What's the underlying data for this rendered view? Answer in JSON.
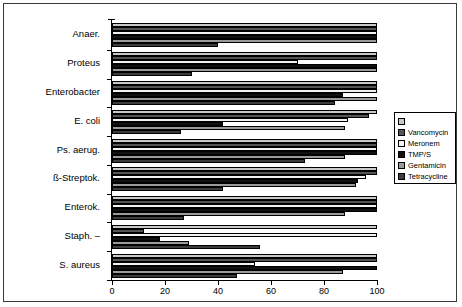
{
  "chart_data": {
    "type": "bar",
    "orientation": "horizontal",
    "title": "",
    "xlabel": "",
    "ylabel": "",
    "xlim": [
      0,
      100
    ],
    "xticks": [
      0,
      20,
      40,
      60,
      80,
      100
    ],
    "grid": false,
    "legend_position": "right",
    "categories": [
      "Anaer.",
      "Proteus",
      "Enterobacter",
      "E. coli",
      "Ps. aerug.",
      "ß-Streptok.",
      "Enterok.",
      "Staph. –",
      "S. aureus"
    ],
    "series": [
      {
        "name": "",
        "color": "#c8c8c8",
        "values": [
          100,
          100,
          100,
          100,
          100,
          100,
          100,
          100,
          100
        ]
      },
      {
        "name": "Vancomycin",
        "color": "#555555",
        "values": [
          100,
          100,
          100,
          97,
          100,
          100,
          100,
          12,
          100
        ]
      },
      {
        "name": "Meronem",
        "color": "#f2f2f2",
        "values": [
          100,
          70,
          100,
          89,
          100,
          96,
          100,
          100,
          54
        ]
      },
      {
        "name": "TMP/S",
        "color": "#111111",
        "values": [
          100,
          100,
          87,
          42,
          100,
          93,
          100,
          18,
          100
        ]
      },
      {
        "name": "Gentamicin",
        "color": "#9a9a9a",
        "values": [
          100,
          100,
          100,
          88,
          88,
          92,
          88,
          29,
          87
        ]
      },
      {
        "name": "Tetracycline",
        "color": "#3c3c3c",
        "values": [
          40,
          30,
          84,
          26,
          73,
          42,
          27,
          56,
          47
        ]
      }
    ]
  },
  "legend": {
    "items": [
      {
        "label": "",
        "icon": "legend-swatch-series-1"
      },
      {
        "label": "Vancomycin",
        "icon": "legend-swatch-series-2"
      },
      {
        "label": "Meronem",
        "icon": "legend-swatch-series-3"
      },
      {
        "label": "TMP/S",
        "icon": "legend-swatch-series-4"
      },
      {
        "label": "Gentamicin",
        "icon": "legend-swatch-series-5"
      },
      {
        "label": "Tetracycline",
        "icon": "legend-swatch-series-6"
      }
    ]
  }
}
